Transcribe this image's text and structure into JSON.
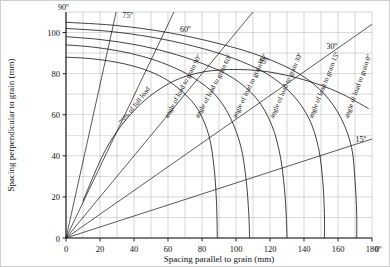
{
  "chart_data": {
    "type": "line",
    "title": "",
    "xlabel": "Spacing parallel to grain (mm)",
    "ylabel": "Spacing perpendicular to grain (mm)",
    "xlim": [
      0,
      180
    ],
    "ylim": [
      0,
      110
    ],
    "xticks": [
      0,
      20,
      40,
      60,
      80,
      100,
      120,
      140,
      160,
      180
    ],
    "yticks": [
      0,
      20,
      40,
      60,
      80,
      100
    ],
    "grid": true,
    "grid_step": 10,
    "legend": "none",
    "corner_labels": {
      "top_left": "90º",
      "bottom_right": "0º"
    },
    "radial_labels": [
      "90º",
      "75º",
      "60º",
      "45º",
      "30º",
      "15º",
      "0º"
    ],
    "radial_lines": [
      {
        "angle_deg": 90,
        "label": "90º",
        "from": [
          0,
          0
        ],
        "to": [
          0,
          110
        ]
      },
      {
        "angle_deg": 75,
        "label": "75º",
        "from": [
          0,
          0
        ],
        "to": [
          29.5,
          110
        ]
      },
      {
        "angle_deg": 60,
        "label": "60º",
        "from": [
          0,
          0
        ],
        "to": [
          63.5,
          110
        ]
      },
      {
        "angle_deg": 45,
        "label": "45º",
        "from": [
          0,
          0
        ],
        "to": [
          110,
          110
        ]
      },
      {
        "angle_deg": 30,
        "label": "30º",
        "from": [
          0,
          0
        ],
        "to": [
          180,
          104
        ]
      },
      {
        "angle_deg": 15,
        "label": "15º",
        "from": [
          0,
          0
        ],
        "to": [
          180,
          48.2
        ]
      },
      {
        "angle_deg": 0,
        "label": "0º",
        "from": [
          0,
          0
        ],
        "to": [
          180,
          0
        ]
      }
    ],
    "series": [
      {
        "name": "angle of load to grain 90º",
        "label": "angle of load to grain 90º",
        "y_intercept": 88,
        "x_intercept": 89,
        "points": [
          [
            0,
            88
          ],
          [
            10,
            87.6
          ],
          [
            20,
            86.8
          ],
          [
            30,
            85.5
          ],
          [
            40,
            83.6
          ],
          [
            50,
            80.8
          ],
          [
            60,
            76.6
          ],
          [
            70,
            70.0
          ],
          [
            78,
            62.0
          ],
          [
            84,
            50.0
          ],
          [
            87,
            35.0
          ],
          [
            88.5,
            18.0
          ],
          [
            89,
            0
          ]
        ]
      },
      {
        "name": "angle of load to grain 60º",
        "label": "angle of load to grain 60º",
        "y_intercept": 94,
        "x_intercept": 108,
        "points": [
          [
            0,
            94
          ],
          [
            15,
            93.0
          ],
          [
            30,
            91.2
          ],
          [
            45,
            88.4
          ],
          [
            60,
            84.2
          ],
          [
            75,
            78.0
          ],
          [
            88,
            69.5
          ],
          [
            97,
            58.0
          ],
          [
            103,
            44.0
          ],
          [
            106,
            28.0
          ],
          [
            107.5,
            12.0
          ],
          [
            108,
            0
          ]
        ]
      },
      {
        "name": "angle of load to grain 45º",
        "label": "angle of load to grain 45º",
        "y_intercept": 98,
        "x_intercept": 130,
        "points": [
          [
            0,
            98
          ],
          [
            20,
            96.6
          ],
          [
            40,
            94.2
          ],
          [
            60,
            90.4
          ],
          [
            80,
            85.0
          ],
          [
            98,
            78.0
          ],
          [
            112,
            68.0
          ],
          [
            121,
            55.0
          ],
          [
            126,
            40.0
          ],
          [
            128.5,
            24.0
          ],
          [
            129.6,
            10.0
          ],
          [
            130,
            0
          ]
        ]
      },
      {
        "name": "angle of load to grain 30º",
        "label": "angle of load to grain 30º",
        "y_intercept": 102,
        "x_intercept": 152,
        "points": [
          [
            0,
            102
          ],
          [
            25,
            100.6
          ],
          [
            50,
            97.8
          ],
          [
            75,
            93.4
          ],
          [
            98,
            87.6
          ],
          [
            118,
            80.0
          ],
          [
            133,
            70.0
          ],
          [
            143,
            58.0
          ],
          [
            148.5,
            44.0
          ],
          [
            151,
            28.0
          ],
          [
            152,
            12.0
          ],
          [
            152,
            0
          ]
        ]
      },
      {
        "name": "angle of load to grain 15º",
        "label": "angle of load to grain 15º",
        "y_intercept": 105,
        "x_intercept": 171,
        "points": [
          [
            0,
            105
          ],
          [
            30,
            103.4
          ],
          [
            60,
            100.0
          ],
          [
            90,
            94.6
          ],
          [
            115,
            88.4
          ],
          [
            137,
            80.0
          ],
          [
            152,
            70.0
          ],
          [
            162,
            58.0
          ],
          [
            168,
            44.0
          ],
          [
            170,
            28.0
          ],
          [
            171,
            12.0
          ],
          [
            171,
            0
          ]
        ]
      }
    ],
    "annotations": [
      {
        "text": "75% of full load",
        "kind": "curve-label"
      },
      {
        "text": "angle of load to grain 90º",
        "kind": "curve-label"
      },
      {
        "text": "angle of load to grain 60º",
        "kind": "curve-label"
      },
      {
        "text": "angle of load to grain 45º",
        "kind": "curve-label"
      },
      {
        "text": "angle of load to grain 30º",
        "kind": "curve-label"
      },
      {
        "text": "angle of load to grain 15º",
        "kind": "curve-label"
      },
      {
        "text": "angle of load to grain 0º",
        "kind": "curve-label"
      }
    ],
    "reduced_load_curve": {
      "name": "75% of full load",
      "label": "75% of full load",
      "points": [
        [
          10,
          18
        ],
        [
          24,
          44
        ],
        [
          40,
          62
        ],
        [
          58,
          74
        ],
        [
          76,
          80
        ],
        [
          96,
          82
        ],
        [
          118,
          81
        ],
        [
          140,
          77
        ],
        [
          160,
          71
        ],
        [
          178,
          63
        ]
      ]
    }
  },
  "labels": {
    "xaxis": "Spacing parallel to grain (mm)",
    "yaxis": "Spacing perpendicular to grain (mm)",
    "angle_90": "90º",
    "angle_75": "75º",
    "angle_60": "60º",
    "angle_45": "45º",
    "angle_30": "30º",
    "angle_15": "15º",
    "angle_0": "0º",
    "t0": "0",
    "t20": "20",
    "t40": "40",
    "t60": "60",
    "t80": "80",
    "t100": "100",
    "t120": "120",
    "t140": "140",
    "t160": "160",
    "t180": "180",
    "y0": "0",
    "y20": "20",
    "y40": "40",
    "y60": "60",
    "y80": "80",
    "y100": "100",
    "c75": "75%",
    "c_of": "of",
    "c_full": "full",
    "c_load": "load",
    "lab_angle": "angle",
    "lab_of": "of",
    "lab_load": "load",
    "lab_to": "to",
    "lab_grain": "grain",
    "curve90": "angle of load to grain 90º",
    "curve60": "angle of load to grain 60º",
    "curve45": "angle of load to grain 45º",
    "curve30": "angle of load to grain 30º",
    "curve15": "angle of load to grain 15º",
    "curve0": "angle of load to grain 0º"
  },
  "colors": {
    "ink": "#111111",
    "grid": "#9a9a9a",
    "background": "#ffffff"
  }
}
